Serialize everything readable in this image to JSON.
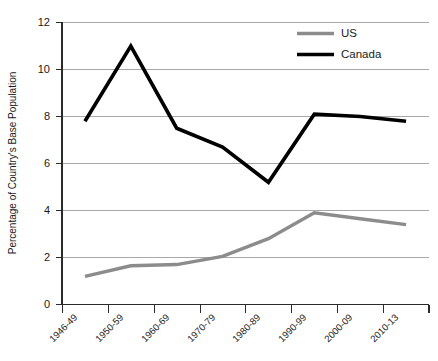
{
  "chart_data": {
    "type": "line",
    "title": "",
    "xlabel": "",
    "ylabel": "Percentage of Country's Base Population",
    "categories": [
      "1946-49",
      "1950-59",
      "1960-69",
      "1970-79",
      "1980-89",
      "1990-99",
      "2000-09",
      "2010-13"
    ],
    "series": [
      {
        "name": "US",
        "color": "#8c8c8c",
        "values": [
          1.2,
          1.65,
          1.7,
          2.05,
          2.8,
          3.9,
          3.65,
          3.4
        ]
      },
      {
        "name": "Canada",
        "color": "#000000",
        "values": [
          7.8,
          11.0,
          7.5,
          6.7,
          5.2,
          8.1,
          8.0,
          7.8
        ]
      }
    ],
    "ylim": [
      0,
      12
    ],
    "yticks": [
      0,
      2,
      4,
      6,
      8,
      10,
      12
    ],
    "ytick_labels": [
      "0",
      "2",
      "4",
      "6",
      "8",
      "10",
      "12"
    ],
    "grid": "horizontal",
    "legend_position": "top-right"
  },
  "legend": {
    "entries": [
      {
        "label": "US"
      },
      {
        "label": "Canada"
      }
    ]
  }
}
